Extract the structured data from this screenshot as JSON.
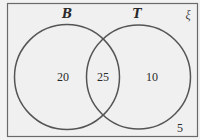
{
  "diagram": {
    "type": "venn",
    "universal_set": {
      "label": "ξ",
      "outside_value": "5"
    },
    "sets": [
      {
        "label": "B",
        "only_value": "20"
      },
      {
        "label": "T",
        "only_value": "10"
      }
    ],
    "intersection_value": "25",
    "colors": {
      "background": "#f2f2f2",
      "stroke": "#555555",
      "text": "#2a2a2a"
    }
  }
}
